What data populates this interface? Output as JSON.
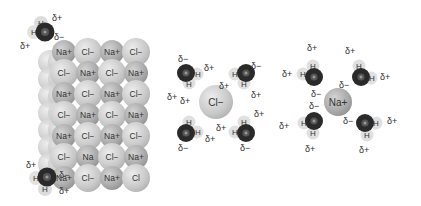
{
  "figure": {
    "charges": {
      "partial_positive": "δ+",
      "partial_negative": "δ−"
    },
    "atoms": {
      "hydrogen": "H",
      "oxygen": "O"
    },
    "crystal": {
      "rows": [
        [
          "Na+",
          "Cl−",
          "Na+",
          "Cl−"
        ],
        [
          "Cl−",
          "Na+",
          "Cl−",
          "Na+"
        ],
        [
          "Na+",
          "Cl−",
          "Na+",
          "Cl−"
        ],
        [
          "Cl−",
          "Na+",
          "Cl−",
          "Na+"
        ],
        [
          "Na+",
          "Cl−",
          "Na+",
          "Cl−"
        ],
        [
          "Cl−",
          "Na",
          "Cl−",
          "Na+"
        ],
        [
          "Na+",
          "Cl−",
          "Na+",
          "Cl"
        ]
      ]
    },
    "hydrated_chloride": {
      "ion_label": "Cl−"
    },
    "hydrated_sodium": {
      "ion_label": "Na+"
    }
  }
}
